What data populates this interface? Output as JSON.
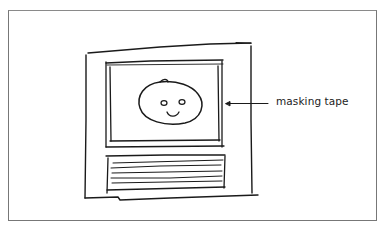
{
  "figure": {
    "type": "hand-drawn sketch",
    "colors": {
      "ink": "#1a1a1a",
      "frame_border": "#777777",
      "background": "#ffffff"
    }
  },
  "annotations": [
    {
      "label": "masking tape",
      "points_to": "right edge of screen frame",
      "arrow_direction": "left"
    }
  ],
  "elements": {
    "cabinet": {
      "shape": "rough rectangle"
    },
    "screen": {
      "shape": "double-outlined rectangle",
      "content": "smiley face"
    },
    "face": {
      "eyes": 2,
      "mouth": "smile"
    },
    "slat_panel": {
      "lines": 5
    }
  }
}
